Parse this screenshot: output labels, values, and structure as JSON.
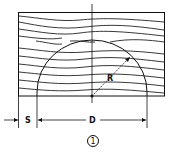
{
  "diagram": {
    "labels": {
      "radius": "R",
      "diameter": "D",
      "spacing": "S",
      "figure_number": "1"
    },
    "colors": {
      "stroke": "#111111",
      "background": "#ffffff"
    }
  }
}
